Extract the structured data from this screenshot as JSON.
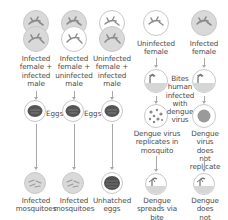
{
  "colors": {
    "infected_fill": "#d9d9d9",
    "uninfected_fill": "#ffffff",
    "outline": "#c8c8c8",
    "mosquito": "#8a8a8a",
    "egg": "#555555",
    "virus": "#8a8a8a",
    "arrow": "#a8a8a8",
    "text": "#4a4a4a"
  },
  "columns": [
    {
      "id": "cross-1",
      "top_label": "Infected\nfemale +\ninfected\nmale",
      "parents": [
        "infected",
        "infected"
      ],
      "middle_label": "Eggs",
      "outcome_label": "Infected\nmosquitoes"
    },
    {
      "id": "cross-2",
      "top_label": "Infected\nfemale +\nuninfected\nmale",
      "parents": [
        "infected",
        "uninfected"
      ],
      "middle_label": "Eggs",
      "outcome_label": "Infected\nmosquitoes"
    },
    {
      "id": "cross-3",
      "top_label": "Uninfected\nfemale +\ninfected\nmale",
      "parents": [
        "uninfected",
        "infected"
      ],
      "middle_label": "",
      "outcome_label": "Unhatched\neggs"
    },
    {
      "id": "uninfected-female",
      "top_label": "Uninfected\nfemale",
      "virus_label": "Dengue virus\nreplicates in\nmosquito",
      "outcome_label": "Dengue\nspreads via\nbite"
    },
    {
      "id": "infected-female",
      "top_label": "Infected\nfemale",
      "virus_label": "Dengue\nvirus does\nnot replicate",
      "outcome_label": "Dengue does\nnot spread"
    }
  ],
  "shared_label": "Bites\nhuman\ninfected\nwith\ndengue\nvirus"
}
